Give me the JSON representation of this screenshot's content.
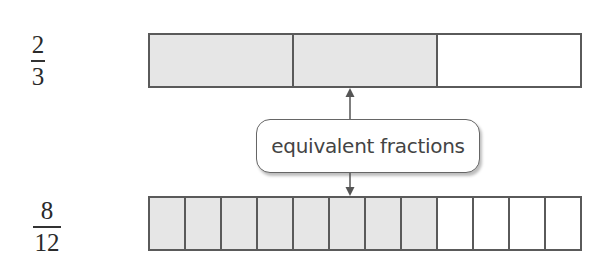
{
  "top": {
    "fraction": {
      "numerator": "2",
      "denominator": "3"
    },
    "parts": 3,
    "shaded": 2
  },
  "bottom": {
    "fraction": {
      "numerator": "8",
      "denominator": "12"
    },
    "parts": 12,
    "shaded": 8
  },
  "callout": {
    "label": "equivalent fractions"
  },
  "colors": {
    "shaded": "#e6e6e6",
    "unshaded": "#ffffff",
    "border": "#5a5a5a"
  }
}
